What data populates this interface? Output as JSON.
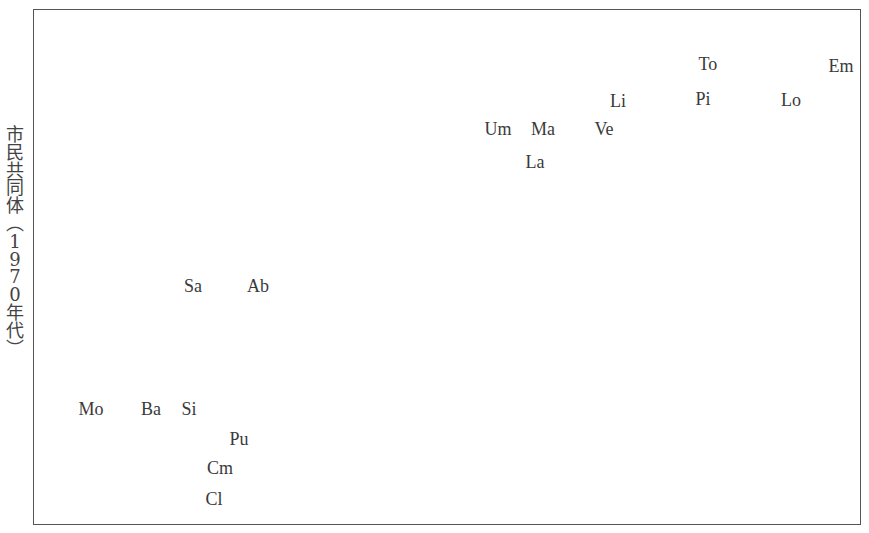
{
  "chart_data": {
    "type": "scatter",
    "title": "",
    "xlabel": "",
    "ylabel": "市民共同体（1970年代）",
    "grid": false,
    "legend": null,
    "note": "Text-label scatter plot; points are region abbreviations placed by pixel position (no numeric axis ticks shown). x/y given in plot pixel coordinates (origin top-left of frame).",
    "points": [
      {
        "label": "To",
        "x": 708,
        "y": 64
      },
      {
        "label": "Em",
        "x": 841,
        "y": 66
      },
      {
        "label": "Li",
        "x": 618,
        "y": 101
      },
      {
        "label": "Pi",
        "x": 703,
        "y": 99
      },
      {
        "label": "Lo",
        "x": 791,
        "y": 100
      },
      {
        "label": "Um",
        "x": 498,
        "y": 129
      },
      {
        "label": "Ma",
        "x": 543,
        "y": 129
      },
      {
        "label": "Ve",
        "x": 604,
        "y": 129
      },
      {
        "label": "La",
        "x": 535,
        "y": 162
      },
      {
        "label": "Sa",
        "x": 193,
        "y": 286
      },
      {
        "label": "Ab",
        "x": 258,
        "y": 286
      },
      {
        "label": "Mo",
        "x": 91,
        "y": 409
      },
      {
        "label": "Ba",
        "x": 151,
        "y": 409
      },
      {
        "label": "Si",
        "x": 189,
        "y": 409
      },
      {
        "label": "Pu",
        "x": 239,
        "y": 439
      },
      {
        "label": "Cm",
        "x": 220,
        "y": 468
      },
      {
        "label": "Cl",
        "x": 214,
        "y": 499
      }
    ]
  },
  "ylabel_chars": [
    "市",
    "民",
    "共",
    "同",
    "体",
    "︵",
    "1",
    "9",
    "7",
    "0",
    "年",
    "代",
    "︶"
  ]
}
